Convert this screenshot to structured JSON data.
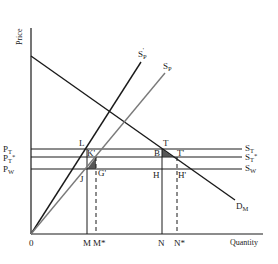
{
  "axes": {
    "y_label": "Price",
    "x_label": "Quantity",
    "origin_label": "0"
  },
  "price_levels": [
    {
      "id": "pt",
      "label": "P",
      "sub": "T",
      "sup": "",
      "line_label": "S",
      "line_sub": "T",
      "line_sup": ""
    },
    {
      "id": "pts",
      "label": "P",
      "sub": "T",
      "sup": "*",
      "line_label": "S",
      "line_sub": "T",
      "line_sup": "*"
    },
    {
      "id": "pw",
      "label": "P",
      "sub": "W",
      "sup": "",
      "line_label": "S",
      "line_sub": "W",
      "line_sup": ""
    }
  ],
  "curves": {
    "demand": {
      "label": "D",
      "sub": "M"
    },
    "supply_p_prime": {
      "label": "S",
      "sub": "P",
      "sup": "'"
    },
    "supply_p": {
      "label": "S",
      "sub": "P"
    }
  },
  "quantity_marks": [
    {
      "id": "m",
      "label": "M",
      "style": "solid"
    },
    {
      "id": "ms",
      "label": "M*",
      "style": "dashed"
    },
    {
      "id": "n",
      "label": "N",
      "style": "solid"
    },
    {
      "id": "ns",
      "label": "N*",
      "style": "dashed"
    }
  ],
  "points": {
    "L": "L",
    "K": "K'",
    "J": "J",
    "G": "G'",
    "T": "T",
    "B": "B",
    "Tp": "T'",
    "H": "H",
    "Hp": "H'"
  },
  "colors": {
    "ink": "#1a1a1a",
    "supply_p": "#7a7a7a",
    "shade": "#3a3a3a"
  }
}
